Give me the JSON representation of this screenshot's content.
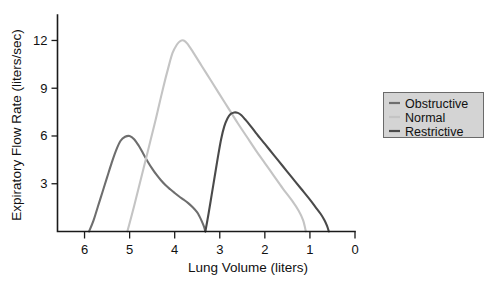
{
  "chart_data": {
    "type": "line",
    "title": "",
    "xlabel": "Lung Volume (liters)",
    "ylabel": "Expiratory Flow Rate (liters/sec)",
    "xlim": [
      6.6,
      0
    ],
    "ylim": [
      0,
      13.6
    ],
    "x_ticks": [
      6,
      5,
      4,
      3,
      2,
      1,
      0
    ],
    "x_tick_labels": [
      "6",
      "5",
      "4",
      "3",
      "2",
      "1",
      "0"
    ],
    "y_ticks": [
      3,
      6,
      9,
      12
    ],
    "y_tick_labels": [
      "3",
      "6",
      "9",
      "12"
    ],
    "x_axis_inverted": true,
    "grid": false,
    "legend_position": "right",
    "series": [
      {
        "name": "Obstructive",
        "color": "#6e6e6e",
        "points": [
          [
            5.9,
            0.0
          ],
          [
            5.8,
            0.7
          ],
          [
            5.7,
            1.6
          ],
          [
            5.6,
            2.5
          ],
          [
            5.5,
            3.4
          ],
          [
            5.4,
            4.3
          ],
          [
            5.3,
            5.1
          ],
          [
            5.2,
            5.7
          ],
          [
            5.1,
            5.95
          ],
          [
            5.0,
            6.0
          ],
          [
            4.9,
            5.8
          ],
          [
            4.8,
            5.4
          ],
          [
            4.7,
            4.9
          ],
          [
            4.6,
            4.4
          ],
          [
            4.5,
            3.95
          ],
          [
            4.4,
            3.55
          ],
          [
            4.3,
            3.2
          ],
          [
            4.2,
            2.9
          ],
          [
            4.1,
            2.65
          ],
          [
            4.0,
            2.42
          ],
          [
            3.9,
            2.2
          ],
          [
            3.8,
            2.0
          ],
          [
            3.7,
            1.78
          ],
          [
            3.6,
            1.52
          ],
          [
            3.5,
            1.2
          ],
          [
            3.45,
            0.95
          ],
          [
            3.4,
            0.65
          ],
          [
            3.35,
            0.3
          ],
          [
            3.32,
            0.0
          ]
        ]
      },
      {
        "name": "Normal",
        "color": "#c4c4c4",
        "points": [
          [
            5.05,
            0.0
          ],
          [
            4.9,
            1.6
          ],
          [
            4.75,
            3.3
          ],
          [
            4.6,
            5.0
          ],
          [
            4.45,
            6.7
          ],
          [
            4.35,
            7.9
          ],
          [
            4.25,
            9.1
          ],
          [
            4.15,
            10.2
          ],
          [
            4.05,
            11.2
          ],
          [
            3.95,
            11.75
          ],
          [
            3.87,
            11.98
          ],
          [
            3.8,
            12.0
          ],
          [
            3.72,
            11.8
          ],
          [
            3.6,
            11.3
          ],
          [
            3.4,
            10.4
          ],
          [
            3.2,
            9.5
          ],
          [
            3.0,
            8.6
          ],
          [
            2.8,
            7.7
          ],
          [
            2.6,
            6.8
          ],
          [
            2.4,
            5.95
          ],
          [
            2.2,
            5.1
          ],
          [
            2.0,
            4.3
          ],
          [
            1.8,
            3.5
          ],
          [
            1.6,
            2.7
          ],
          [
            1.4,
            1.95
          ],
          [
            1.25,
            1.3
          ],
          [
            1.15,
            0.7
          ],
          [
            1.09,
            0.0
          ]
        ]
      },
      {
        "name": "Restrictive",
        "color": "#4a4a4a",
        "points": [
          [
            3.32,
            0.0
          ],
          [
            3.25,
            1.1
          ],
          [
            3.18,
            2.3
          ],
          [
            3.11,
            3.5
          ],
          [
            3.04,
            4.7
          ],
          [
            2.97,
            5.8
          ],
          [
            2.9,
            6.6
          ],
          [
            2.83,
            7.1
          ],
          [
            2.76,
            7.38
          ],
          [
            2.68,
            7.48
          ],
          [
            2.6,
            7.45
          ],
          [
            2.52,
            7.3
          ],
          [
            2.44,
            7.05
          ],
          [
            2.35,
            6.75
          ],
          [
            2.2,
            6.2
          ],
          [
            2.0,
            5.5
          ],
          [
            1.8,
            4.8
          ],
          [
            1.6,
            4.1
          ],
          [
            1.4,
            3.4
          ],
          [
            1.2,
            2.7
          ],
          [
            1.0,
            2.0
          ],
          [
            0.88,
            1.55
          ],
          [
            0.76,
            1.1
          ],
          [
            0.68,
            0.72
          ],
          [
            0.62,
            0.35
          ],
          [
            0.58,
            0.0
          ]
        ]
      }
    ],
    "legend_entries": [
      {
        "label": "Obstructive",
        "color": "#6e6e6e"
      },
      {
        "label": "Normal",
        "color": "#c4c4c4"
      },
      {
        "label": "Restrictive",
        "color": "#4a4a4a"
      }
    ]
  }
}
